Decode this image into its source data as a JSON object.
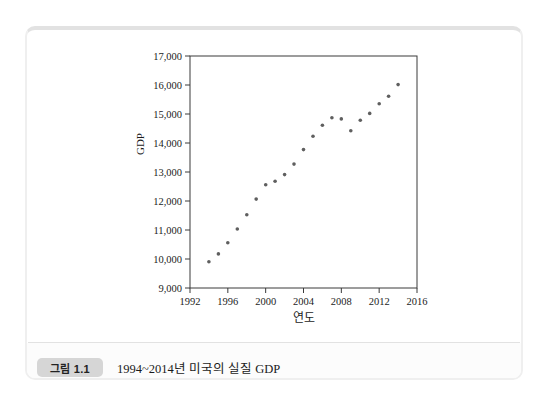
{
  "figure": {
    "badge_label": "그림 1.1",
    "caption": "1994~2014년 미국의 실질 GDP"
  },
  "chart_data": {
    "type": "scatter",
    "title": "",
    "xlabel": "연도",
    "ylabel": "GDP",
    "xlim": [
      1992,
      2016
    ],
    "ylim": [
      9000,
      17000
    ],
    "x_ticks": [
      1992,
      1996,
      2000,
      2004,
      2008,
      2012,
      2016
    ],
    "y_ticks": [
      9000,
      10000,
      11000,
      12000,
      13000,
      14000,
      15000,
      16000,
      17000
    ],
    "grid": false,
    "legend": "none",
    "frame": "box",
    "marker_color": "#5f5f5f",
    "axis_color": "#3a3a3a",
    "x": [
      1994,
      1995,
      1996,
      1997,
      1998,
      1999,
      2000,
      2001,
      2002,
      2003,
      2004,
      2005,
      2006,
      2007,
      2008,
      2009,
      2010,
      2011,
      2012,
      2013,
      2014
    ],
    "y": [
      9905,
      10175,
      10561,
      11035,
      11526,
      12066,
      12560,
      12682,
      12909,
      13271,
      13774,
      14234,
      14614,
      14874,
      14830,
      14419,
      14784,
      15021,
      15355,
      15612,
      16013
    ]
  }
}
